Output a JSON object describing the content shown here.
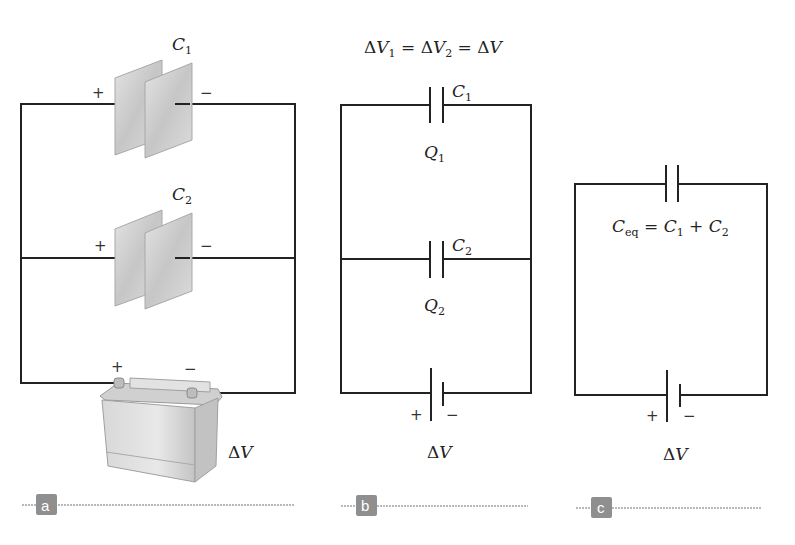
{
  "panels": {
    "a": {
      "tag": "a",
      "capacitor_top": {
        "symbol": "C",
        "sub": "1",
        "plus": "+",
        "minus": "−"
      },
      "capacitor_bottom": {
        "symbol": "C",
        "sub": "2",
        "plus": "+",
        "minus": "−"
      },
      "battery": {
        "plus": "+",
        "minus": "−",
        "label_delta": "Δ",
        "label_v": "V"
      }
    },
    "b": {
      "tag": "b",
      "equation": {
        "d1": "Δ",
        "v1": "V",
        "s1": "1",
        "eq1": " = ",
        "d2": "Δ",
        "v2": "V",
        "s2": "2",
        "eq2": " = ",
        "d3": "Δ",
        "v3": "V"
      },
      "capacitor_top": {
        "symbol": "C",
        "sub": "1",
        "charge": "Q",
        "charge_sub": "1"
      },
      "capacitor_bottom": {
        "symbol": "C",
        "sub": "2",
        "charge": "Q",
        "charge_sub": "2"
      },
      "battery": {
        "plus": "+",
        "minus": "−",
        "label_delta": "Δ",
        "label_v": "V"
      }
    },
    "c": {
      "tag": "c",
      "equation": {
        "c": "C",
        "c_sub": "eq",
        "eq": " = ",
        "c1": "C",
        "s1": "1",
        "plus": " + ",
        "c2": "C",
        "s2": "2"
      },
      "battery": {
        "plus": "+",
        "minus": "−",
        "label_delta": "Δ",
        "label_v": "V"
      }
    }
  },
  "colors": {
    "wire": "#222222",
    "plate": "#c8c8c8",
    "tag_bg": "#8f8f8f",
    "divider": "#b8b8b8"
  }
}
